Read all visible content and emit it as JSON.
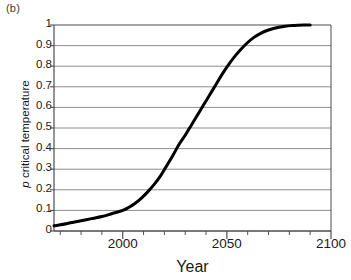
{
  "panel": {
    "label": "(b)"
  },
  "chart_data": {
    "type": "line",
    "title": "",
    "panel_label": "(b)",
    "xlabel": "Year",
    "ylabel": "p critical temperature",
    "ylabel_italic_prefix": "p",
    "ylabel_rest": " critical temperature",
    "xlim": [
      1967,
      2100
    ],
    "ylim": [
      0,
      1
    ],
    "grid": "horizontal",
    "legend": "none",
    "line_color": "#000000",
    "grid_color": "#808080",
    "axis_color": "#4d4d4d",
    "xticks_major": [
      2000,
      2050,
      2100
    ],
    "xtick_labels": [
      "2000",
      "2050",
      "2100"
    ],
    "xticks_minor": [
      1970,
      1980,
      1990,
      2010,
      2020,
      2030,
      2040,
      2060,
      2070,
      2080,
      2090
    ],
    "yticks": [
      0,
      0.1,
      0.2,
      0.3,
      0.4,
      0.5,
      0.6,
      0.7,
      0.8,
      0.9,
      1
    ],
    "ytick_labels": [
      "0",
      "0.1",
      "0.2",
      "0.3",
      "0.4",
      "0.5",
      "0.6",
      "0.7",
      "0.8",
      "0.9",
      "1"
    ],
    "series": [
      {
        "name": "p critical temperature",
        "x": [
          1967,
          1970,
          1975,
          1980,
          1985,
          1990,
          1995,
          2000,
          2003,
          2006,
          2009,
          2012,
          2015,
          2018,
          2021,
          2024,
          2027,
          2030,
          2033,
          2036,
          2039,
          2042,
          2045,
          2048,
          2051,
          2054,
          2057,
          2060,
          2063,
          2066,
          2069,
          2072,
          2075,
          2078,
          2081,
          2084,
          2087,
          2090
        ],
        "values": [
          0.025,
          0.03,
          0.04,
          0.05,
          0.06,
          0.07,
          0.085,
          0.1,
          0.115,
          0.135,
          0.16,
          0.19,
          0.225,
          0.265,
          0.315,
          0.365,
          0.42,
          0.465,
          0.515,
          0.565,
          0.615,
          0.665,
          0.715,
          0.765,
          0.81,
          0.85,
          0.885,
          0.915,
          0.94,
          0.958,
          0.972,
          0.982,
          0.989,
          0.994,
          0.997,
          0.999,
          1.0,
          1.0
        ]
      }
    ]
  }
}
